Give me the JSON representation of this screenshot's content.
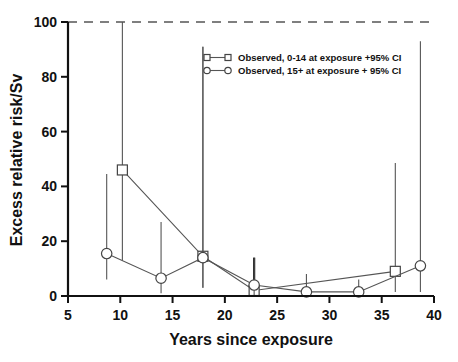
{
  "chart_data": {
    "type": "line",
    "title": "",
    "xlabel": "Years since exposure",
    "ylabel": "Excess relative risk/Sv",
    "xlim": [
      5,
      40
    ],
    "ylim": [
      0,
      100
    ],
    "xticks": [
      5,
      10,
      15,
      20,
      25,
      30,
      35,
      40
    ],
    "yticks": [
      0,
      20,
      40,
      60,
      80,
      100
    ],
    "xtick_labels": [
      "5",
      "10",
      "15",
      "20",
      "25",
      "30",
      "35",
      "40"
    ],
    "ytick_labels": [
      "0",
      "20",
      "40",
      "60",
      "80",
      "100"
    ],
    "grid": false,
    "legend_position": "upper-center",
    "annotations": [
      {
        "name": "upper-limit-dashed-line",
        "type": "hline",
        "y": 100,
        "style": "dashed",
        "note": "confidence interval truncated at top of axis"
      }
    ],
    "series": [
      {
        "name": "Observed, 0-14 at exposure +95% CI",
        "marker": "square",
        "x": [
          10.2,
          17.9,
          22.8,
          36.3
        ],
        "y": [
          46.0,
          14.5,
          2.0,
          9.0
        ],
        "ci_low": [
          13.0,
          3.0,
          0.0,
          1.5
        ],
        "ci_high": [
          100.0,
          91.0,
          14.0,
          48.5
        ]
      },
      {
        "name": "Observed, 15+ at exposure + 95% CI",
        "marker": "circle",
        "x": [
          8.7,
          13.9,
          17.9,
          22.8,
          27.8,
          32.8,
          38.7
        ],
        "y": [
          15.5,
          6.5,
          14.0,
          4.0,
          1.5,
          1.5,
          11.0
        ],
        "ci_low": [
          6.0,
          1.0,
          3.0,
          0.0,
          0.0,
          0.0,
          1.5
        ],
        "ci_high": [
          44.5,
          27.0,
          91.0,
          14.0,
          8.0,
          6.0,
          93.0
        ]
      }
    ],
    "legend": [
      {
        "label": "Observed, 0-14 at exposure +95% CI",
        "marker": "square"
      },
      {
        "label": "Observed, 15+ at exposure + 95% CI",
        "marker": "circle"
      }
    ],
    "colors": {
      "axis": "#111111",
      "series_line": "#555555",
      "marker_fill": "#ffffff",
      "marker_stroke": "#444444",
      "background": "#ffffff"
    }
  }
}
